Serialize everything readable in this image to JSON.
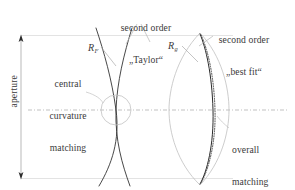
{
  "figure": {
    "background_color": "#ffffff",
    "width": 295,
    "height": 190
  },
  "annotations": {
    "taylor": {
      "line1": "second order",
      "line2": "„Taylor“",
      "full": "second order „Taylor“"
    },
    "best_fit": {
      "line1": "second order",
      "line2": "„best fit“",
      "full": "second order „best fit“"
    },
    "central": {
      "line1": "central",
      "line2": "curvature",
      "line3": "matching",
      "full": "central curvature matching"
    },
    "overall": {
      "line1": "overall",
      "line2": "matching",
      "full": "overall matching"
    },
    "aperture": {
      "text": "aperture"
    }
  },
  "symbols": {
    "radius_left": {
      "base": "R",
      "subscript": "F"
    },
    "radius_right": {
      "base": "R",
      "subscript": "g"
    }
  },
  "colors": {
    "curve_dark": "#231f20",
    "curve_light": "#b7b7b7",
    "guide_light": "#d9d9d9",
    "axis": "#9a9a9a",
    "leader": "#b0b0b0",
    "text": "#3a3a3a",
    "arrow": "#2b2b2b"
  },
  "elements": {
    "aperture_arrow": "double-headed vertical dimension arrow",
    "optical_axis": "horizontal dash-dot centre line",
    "highlight_circle": "circle marking central curvature tangency",
    "left_curves": "aspheric profile and second-order Taylor parabola crossing at vertex",
    "right_lens": "lens outline with solid best-fit curve and dotted aspheric curve"
  }
}
